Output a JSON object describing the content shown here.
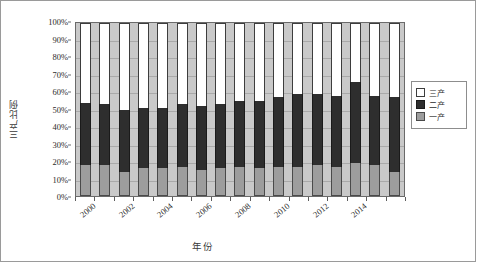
{
  "chart_data": {
    "type": "bar",
    "subtype": "100% stacked column",
    "title": "",
    "xlabel": "年份",
    "ylabel": "三产比例",
    "ylim": [
      0,
      100
    ],
    "ytick_labels": [
      "0%",
      "10%",
      "20%",
      "30%",
      "40%",
      "50%",
      "60%",
      "70%",
      "80%",
      "90%",
      "100%"
    ],
    "ytick_values": [
      0,
      10,
      20,
      30,
      40,
      50,
      60,
      70,
      80,
      90,
      100
    ],
    "grid": true,
    "legend_position": "right",
    "categories": [
      2000,
      2001,
      2002,
      2003,
      2004,
      2005,
      2006,
      2007,
      2008,
      2009,
      2010,
      2011,
      2012,
      2013,
      2014,
      2015,
      2016
    ],
    "xtick_labels": [
      "2000",
      "2002",
      "2004",
      "2006",
      "2008",
      "2010",
      "2012",
      "2014"
    ],
    "series": [
      {
        "name": "一产",
        "color": "#9d9d9d",
        "values": [
          18,
          18,
          14,
          16,
          16,
          17,
          15,
          16,
          17,
          16,
          17,
          17,
          18,
          17,
          19,
          18,
          14
        ]
      },
      {
        "name": "二产",
        "color": "#2e2e2e",
        "values": [
          36,
          35,
          36,
          35,
          35,
          36,
          37,
          37,
          38,
          39,
          40,
          42,
          41,
          41,
          47,
          40,
          43
        ]
      },
      {
        "name": "三产",
        "color": "#ffffff",
        "values": [
          46,
          47,
          50,
          49,
          49,
          47,
          48,
          47,
          45,
          45,
          43,
          41,
          41,
          42,
          34,
          42,
          43
        ]
      }
    ],
    "stack_tops": {
      "primary_top": [
        18,
        18,
        14,
        16,
        16,
        17,
        15,
        16,
        17,
        16,
        17,
        17,
        18,
        17,
        19,
        18,
        14
      ],
      "secondary_top": [
        54,
        53,
        50,
        51,
        51,
        53,
        52,
        53,
        55,
        55,
        57,
        59,
        59,
        58,
        66,
        58,
        57
      ]
    },
    "plot_background": "#c9c9c9",
    "axis_color": "#6a6a6a"
  },
  "legend": {
    "items": [
      {
        "label": "三产",
        "swatch_class": "sw-t"
      },
      {
        "label": "二产",
        "swatch_class": "sw-s"
      },
      {
        "label": "一产",
        "swatch_class": "sw-p"
      }
    ]
  }
}
